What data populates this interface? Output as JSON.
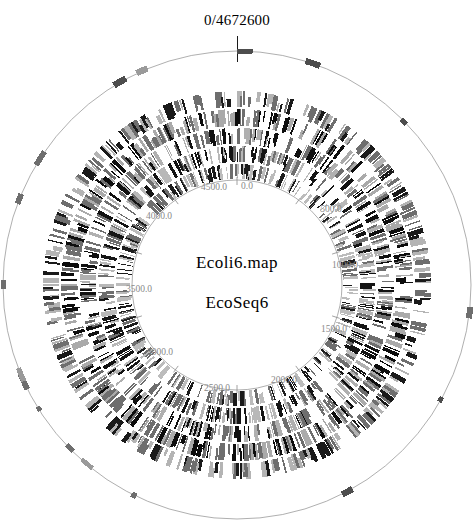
{
  "figure": {
    "type": "circular-genome-map",
    "origin_label": "0/4672600",
    "map_name": "Ecoli6.map",
    "sequence_name": "EcoSeq6",
    "genome_length": 4672600,
    "units": "kb",
    "direction": "clockwise",
    "background_color": "#ffffff",
    "ink_color": "#000000",
    "tick_label_color": "#8a8a8a"
  },
  "center": {
    "x": 237,
    "y": 285
  },
  "scale_ticks": [
    {
      "label": "0.0",
      "value": 0,
      "angle_deg": 0,
      "x": 247,
      "y": 186
    },
    {
      "label": "500.0",
      "value": 500,
      "angle_deg": 38,
      "x": 331,
      "y": 209
    },
    {
      "label": "1000.0",
      "value": 1000,
      "angle_deg": 77,
      "x": 345,
      "y": 265
    },
    {
      "label": "1500.0",
      "value": 1500,
      "angle_deg": 115,
      "x": 334,
      "y": 329
    },
    {
      "label": "2000.0",
      "value": 2000,
      "angle_deg": 154,
      "x": 284,
      "y": 380
    },
    {
      "label": "2500.0",
      "value": 2500,
      "angle_deg": 192,
      "x": 217,
      "y": 388
    },
    {
      "label": "3000.0",
      "value": 3000,
      "angle_deg": 231,
      "x": 160,
      "y": 352
    },
    {
      "label": "3500.0",
      "value": 3500,
      "angle_deg": 269,
      "x": 139,
      "y": 289
    },
    {
      "label": "4000.0",
      "value": 4000,
      "angle_deg": 308,
      "x": 159,
      "y": 216
    },
    {
      "label": "4500.0",
      "value": 4500,
      "angle_deg": 346,
      "x": 214,
      "y": 187
    }
  ],
  "chart_data": {
    "type": "circular-track-map",
    "title": "0/4672600",
    "center_labels": [
      "Ecoli6.map",
      "EcoSeq6"
    ],
    "axis_range": [
      0,
      4672600
    ],
    "tick_labels": [
      "0.0",
      "500.0",
      "1000.0",
      "1500.0",
      "2000.0",
      "2500.0",
      "3000.0",
      "3500.0",
      "4000.0",
      "4500.0"
    ],
    "tick_interval": 500,
    "tracks": [
      {
        "name": "outer-sparse-ring",
        "radius_outer": 238,
        "radius_inner": 230,
        "density": 0.1,
        "feature_count": 170,
        "fill_dark": "#4d4d4d",
        "fill_light": "#9a9a9a",
        "has_baseline_circle": true,
        "seed": 11
      },
      {
        "name": "band-1",
        "radius_outer": 194,
        "radius_inner": 178,
        "density": 0.62,
        "feature_count": 430,
        "fill_dark": "#1a1a1a",
        "fill_light": "#b4b4b4",
        "has_baseline_circle": false,
        "seed": 23
      },
      {
        "name": "band-2",
        "radius_outer": 176,
        "radius_inner": 159,
        "density": 0.66,
        "feature_count": 450,
        "fill_dark": "#0d0d0d",
        "fill_light": "#aaaaaa",
        "has_baseline_circle": false,
        "seed": 37
      },
      {
        "name": "band-3",
        "radius_outer": 157,
        "radius_inner": 141,
        "density": 0.64,
        "feature_count": 440,
        "fill_dark": "#111111",
        "fill_light": "#b0b0b0",
        "has_baseline_circle": false,
        "seed": 53
      },
      {
        "name": "band-4",
        "radius_outer": 139,
        "radius_inner": 123,
        "density": 0.6,
        "feature_count": 420,
        "fill_dark": "#151515",
        "fill_light": "#b8b8b8",
        "has_baseline_circle": false,
        "seed": 71
      },
      {
        "name": "band-5",
        "radius_outer": 121,
        "radius_inner": 106,
        "density": 0.55,
        "feature_count": 400,
        "fill_dark": "#1c1c1c",
        "fill_light": "#bcbcbc",
        "has_baseline_circle": true,
        "seed": 89
      }
    ]
  }
}
